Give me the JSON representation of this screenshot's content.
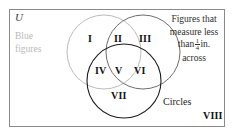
{
  "figure": {
    "title_label": "U",
    "universe_label": "U",
    "set_labels": {
      "left": "Blue figures",
      "right_line1": "Figures that",
      "right_line2": "measure less",
      "right_line3_prefix": "than",
      "right_fraction_numerator": "1",
      "right_fraction_denominator": "4",
      "right_line3_suffix": "in.",
      "right_line4": "across",
      "bottom": "Circles"
    },
    "regions": [
      {
        "id": "I",
        "label": "I",
        "description": "blue figures only"
      },
      {
        "id": "II",
        "label": "II",
        "description": "blue and small"
      },
      {
        "id": "III",
        "label": "III",
        "description": "small figures only"
      },
      {
        "id": "IV",
        "label": "IV",
        "description": "blue and circles"
      },
      {
        "id": "V",
        "label": "V",
        "description": "blue, small and circles"
      },
      {
        "id": "VI",
        "label": "VI",
        "description": "small and circles"
      },
      {
        "id": "VII",
        "label": "VII",
        "description": "circles only"
      },
      {
        "id": "VIII",
        "label": "VIII",
        "description": "outside all sets"
      }
    ],
    "colors": {
      "border": "#8a8a8a",
      "circle_left_stroke": "#bcbcbc",
      "circle_right_stroke": "#6e6e6e",
      "circle_bottom_stroke": "#1c1c1c",
      "left_label_text": "#b9b9b9",
      "right_label_text": "#2c2c2c",
      "numeral_text": "#101010",
      "background": "#ffffff"
    }
  }
}
